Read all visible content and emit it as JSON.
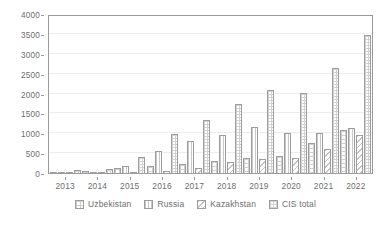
{
  "chart_data": {
    "type": "bar",
    "title": "",
    "subtitle": "",
    "xlabel": "",
    "ylabel": "",
    "categories": [
      "2013",
      "2014",
      "2015",
      "2016",
      "2017",
      "2018",
      "2019",
      "2020",
      "2021",
      "2022"
    ],
    "series": [
      {
        "name": "Uzbekistan",
        "key": "uzbekistan",
        "values": [
          50,
          80,
          140,
          190,
          250,
          340,
          400,
          450,
          770,
          1100
        ]
      },
      {
        "name": "Russia",
        "key": "russia",
        "values": [
          20,
          30,
          200,
          580,
          820,
          970,
          1190,
          1030,
          1030,
          1160
        ]
      },
      {
        "name": "Kazakhstan",
        "key": "kazakhstan",
        "values": [
          0,
          0,
          20,
          70,
          160,
          300,
          390,
          410,
          620,
          980
        ]
      },
      {
        "name": "CIS total",
        "key": "cis_total",
        "values": [
          100,
          130,
          440,
          1000,
          1370,
          1750,
          2110,
          2040,
          2670,
          3500
        ]
      }
    ],
    "ylim": [
      0,
      4000
    ],
    "yticks": [
      0,
      500,
      1000,
      1500,
      2000,
      2500,
      3000,
      3500,
      4000
    ],
    "ytick_labels": [
      "0",
      "500",
      "1000",
      "1500",
      "2000",
      "2500",
      "3000",
      "3500",
      "4000"
    ],
    "grid": true,
    "legend_position": "bottom",
    "colors": {
      "axis": "#9a9a9a",
      "grid": "#ededed",
      "text": "#6d6d6d",
      "bar_border": "#9d9d9d",
      "bar_fill": "#fdfdfd"
    }
  }
}
